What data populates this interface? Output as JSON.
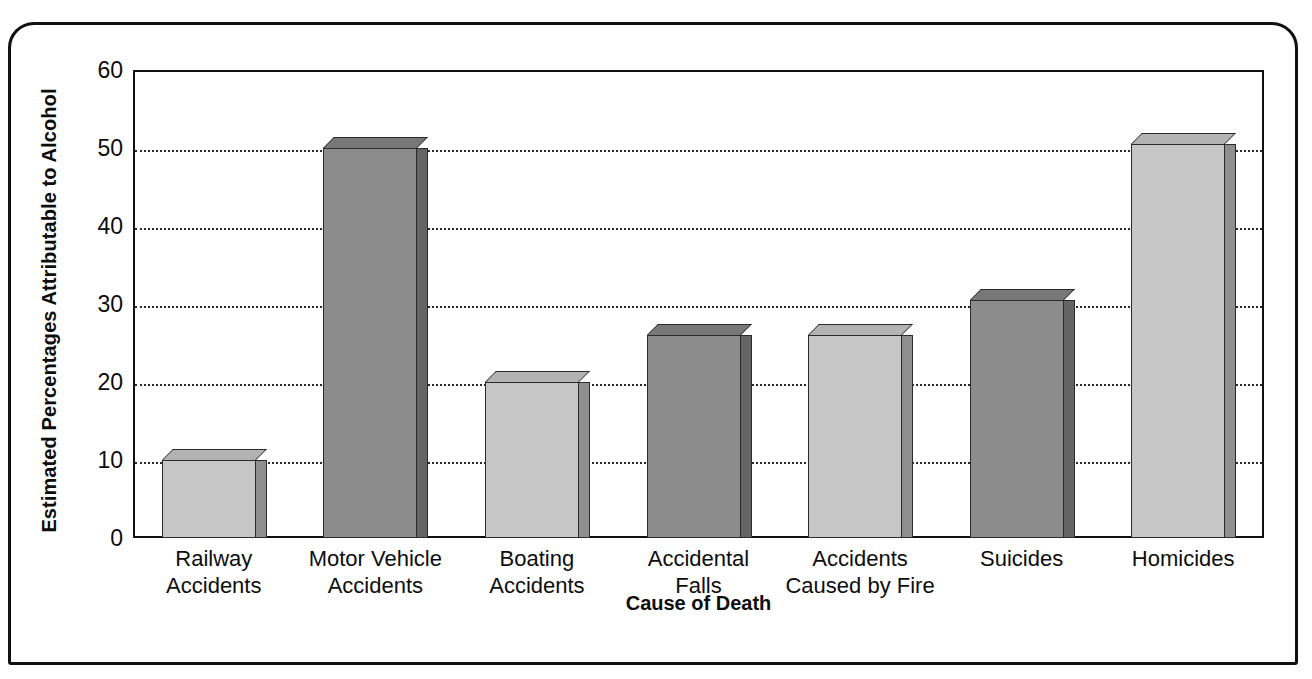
{
  "chart_data": {
    "type": "bar",
    "title": "",
    "xlabel": "Cause of Death",
    "ylabel": "Estimated Percentages Attributable to Alcohol",
    "ylim": [
      0,
      60
    ],
    "ytick_labels": [
      "0",
      "10",
      "20",
      "30",
      "40",
      "50",
      "60"
    ],
    "ytick_values": [
      0,
      10,
      20,
      30,
      40,
      50,
      60
    ],
    "grid": "horizontal-dotted",
    "legend": "none",
    "categories": [
      "Railway Accidents",
      "Motor Vehicle Accidents",
      "Boating Accidents",
      "Accidental Falls",
      "Accidents Caused by Fire",
      "Suicides",
      "Homicides"
    ],
    "category_lines": [
      [
        "Railway",
        "Accidents"
      ],
      [
        "Motor Vehicle",
        "Accidents"
      ],
      [
        "Boating",
        "Accidents"
      ],
      [
        "Accidental",
        "Falls"
      ],
      [
        "Accidents",
        "Caused by Fire"
      ],
      [
        "Suicides",
        ""
      ],
      [
        "Homicides",
        ""
      ]
    ],
    "values": [
      10,
      50,
      20,
      26,
      26,
      30.5,
      50.5
    ],
    "bar_shades": [
      "light",
      "dark",
      "light",
      "dark",
      "light",
      "dark",
      "light"
    ],
    "colors": {
      "bar_light": "#c6c6c6",
      "bar_dark": "#8c8c8c",
      "bar_light_side": "#8f8f8f",
      "bar_dark_side": "#646464",
      "bar_light_top": "#b3b3b3",
      "bar_dark_top": "#787878",
      "outline": "#2b2b2b",
      "axis": "#111111",
      "grid": "#2a2a2a",
      "text": "#0d0d0d",
      "background": "#ffffff"
    }
  }
}
